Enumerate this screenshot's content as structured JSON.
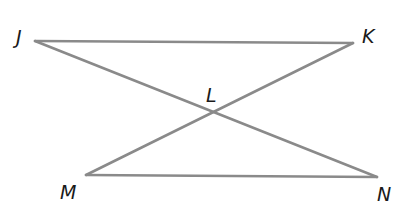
{
  "diagram": {
    "points": {
      "J": {
        "label": "J",
        "x": 35,
        "y": 41
      },
      "K": {
        "label": "K",
        "x": 353,
        "y": 43
      },
      "L": {
        "label": "L",
        "x": 212,
        "y": 111
      },
      "M": {
        "label": "M",
        "x": 86,
        "y": 175
      },
      "N": {
        "label": "N",
        "x": 377,
        "y": 177
      }
    },
    "segments": [
      {
        "name": "JK",
        "from": "J",
        "to": "K"
      },
      {
        "name": "JN",
        "from": "J",
        "to": "N"
      },
      {
        "name": "KM",
        "from": "K",
        "to": "M"
      },
      {
        "name": "MN",
        "from": "M",
        "to": "N"
      }
    ],
    "labels": {
      "J": "J",
      "K": "K",
      "L": "L",
      "M": "M",
      "N": "N"
    },
    "colors": {
      "line": "#8a8a8a",
      "label": "#1a1a1a",
      "background": "#ffffff"
    }
  }
}
